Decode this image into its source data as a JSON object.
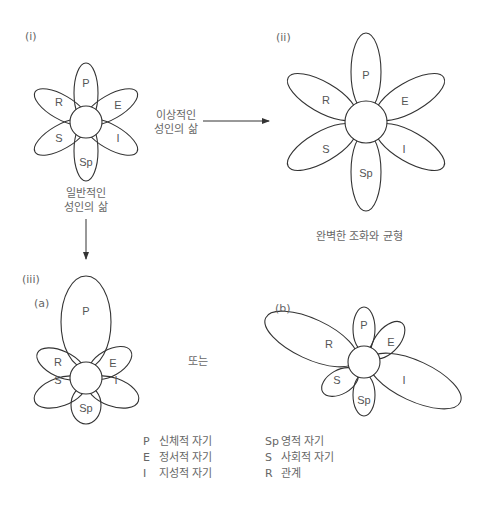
{
  "panels": {
    "i": {
      "label": "(i)",
      "caption_line1": "일반적인",
      "caption_line2": "성인의 삶"
    },
    "ii": {
      "label": "(ii)",
      "caption": "완벽한 조화와 균형"
    },
    "iii": {
      "label": "(iii)",
      "a_label": "(a)",
      "b_label": "(b)",
      "or_text": "또는"
    }
  },
  "arrow_right": {
    "line1": "이상적인",
    "line2": "성인의 삶"
  },
  "petals": {
    "P": "P",
    "E": "E",
    "I": "I",
    "Sp": "Sp",
    "S": "S",
    "R": "R"
  },
  "legend": [
    {
      "key": "P",
      "text": "신체적 자기"
    },
    {
      "key": "E",
      "text": "정서적 자기"
    },
    {
      "key": "I",
      "text": "지성적 자기"
    },
    {
      "key": "Sp",
      "text": "영적 자기"
    },
    {
      "key": "S",
      "text": "사회적 자기"
    },
    {
      "key": "R",
      "text": "관계"
    }
  ]
}
